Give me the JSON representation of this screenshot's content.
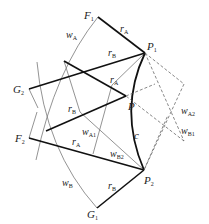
{
  "diagram": {
    "points": {
      "F1": {
        "label": "F",
        "sub": "1",
        "x": 98,
        "y": 17
      },
      "P1": {
        "label": "P",
        "sub": "1",
        "x": 145,
        "y": 53
      },
      "G2": {
        "label": "G",
        "sub": "2",
        "x": 29,
        "y": 89
      },
      "P": {
        "label": "P",
        "sub": "",
        "x": 126,
        "y": 96
      },
      "F2": {
        "label": "F",
        "sub": "2",
        "x": 29,
        "y": 138
      },
      "P2": {
        "label": "P",
        "sub": "2",
        "x": 144,
        "y": 170
      },
      "G1": {
        "label": "G",
        "sub": "1",
        "x": 97,
        "y": 208
      }
    },
    "labels": {
      "rA_top": {
        "text": "r",
        "sub": "A"
      },
      "rB_top": {
        "text": "r",
        "sub": "B"
      },
      "rA_mid": {
        "text": "r",
        "sub": "A"
      },
      "rB_mid": {
        "text": "r",
        "sub": "B"
      },
      "rA_low": {
        "text": "r",
        "sub": "A"
      },
      "rB_bot": {
        "text": "r",
        "sub": "B"
      },
      "wA": {
        "text": "w",
        "sub": "A"
      },
      "wB": {
        "text": "w",
        "sub": "B"
      },
      "wA1": {
        "text": "w",
        "sub": "A1"
      },
      "wB2": {
        "text": "w",
        "sub": "B2"
      },
      "wA2": {
        "text": "w",
        "sub": "A2"
      },
      "wB1": {
        "text": "w",
        "sub": "B1"
      },
      "c": {
        "text": "c"
      }
    },
    "colors": {
      "thick": "#111111",
      "thin": "#666666",
      "dashed": "#555555"
    }
  }
}
